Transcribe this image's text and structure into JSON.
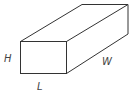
{
  "diagram": {
    "type": "rectangular-prism",
    "labels": {
      "height": "H",
      "length": "L",
      "width": "W"
    },
    "colors": {
      "stroke": "#333333",
      "text": "#444444",
      "background": "#ffffff"
    }
  }
}
